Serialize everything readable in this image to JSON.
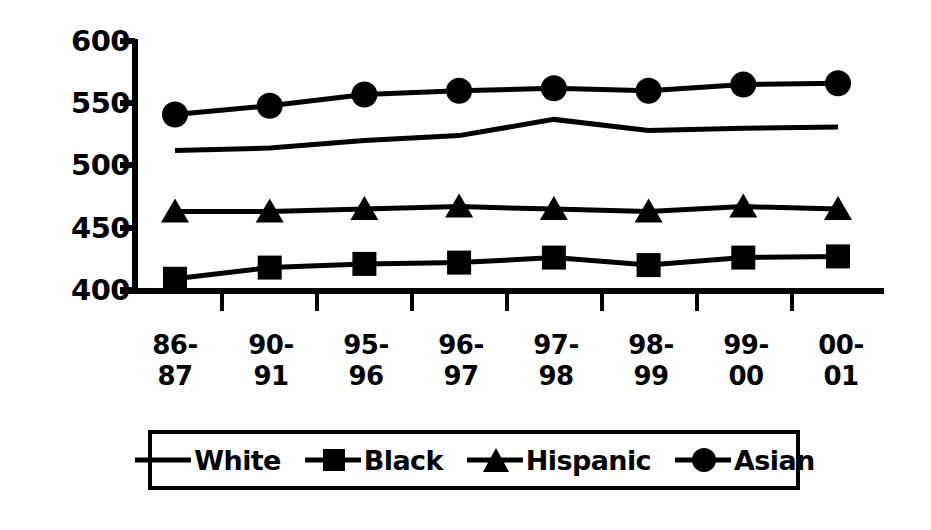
{
  "chart_data": {
    "type": "line",
    "title": "",
    "xlabel": "",
    "ylabel": "",
    "ylim": [
      400,
      600
    ],
    "yticks": [
      400,
      450,
      500,
      550,
      600
    ],
    "ytick_labels": [
      "400",
      "450",
      "500",
      "550",
      "600"
    ],
    "grid": false,
    "legend_position": "bottom",
    "categories": [
      "86-87",
      "90-91",
      "95-96",
      "96-97",
      "97-98",
      "98-99",
      "99-00",
      "00-01"
    ],
    "category_lines": [
      {
        "top": "86-",
        "bottom": "87"
      },
      {
        "top": "90-",
        "bottom": "91"
      },
      {
        "top": "95-",
        "bottom": "96"
      },
      {
        "top": "96-",
        "bottom": "97"
      },
      {
        "top": "97-",
        "bottom": "98"
      },
      {
        "top": "98-",
        "bottom": "99"
      },
      {
        "top": "99-",
        "bottom": "00"
      },
      {
        "top": "00-",
        "bottom": "01"
      }
    ],
    "series": [
      {
        "name": "White",
        "marker": "none",
        "values": [
          512,
          514,
          520,
          524,
          537,
          528,
          530,
          531
        ]
      },
      {
        "name": "Black",
        "marker": "square",
        "values": [
          409,
          418,
          421,
          422,
          426,
          420,
          426,
          427
        ]
      },
      {
        "name": "Hispanic",
        "marker": "triangle",
        "values": [
          463,
          463,
          465,
          467,
          465,
          463,
          467,
          465
        ]
      },
      {
        "name": "Asian",
        "marker": "circle",
        "values": [
          541,
          548,
          557,
          560,
          562,
          560,
          565,
          566
        ]
      }
    ]
  },
  "legend": {
    "items": [
      {
        "label": "White",
        "marker": "line-icon"
      },
      {
        "label": "Black",
        "marker": "square-marker-icon"
      },
      {
        "label": "Hispanic",
        "marker": "triangle-marker-icon"
      },
      {
        "label": "Asian",
        "marker": "circle-marker-icon"
      }
    ]
  },
  "colors": {
    "series": "#000000",
    "axis": "#000000",
    "background": "#ffffff",
    "legend_border": "#000000"
  }
}
